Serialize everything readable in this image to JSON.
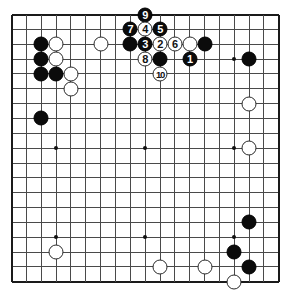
{
  "diagram": {
    "type": "go-board-problem-diagram",
    "board_size": 19,
    "colors": {
      "background": "#ffffff",
      "grid": "#4a4a4a",
      "border": "#1a1a1a",
      "black_stone": "#0b0b0b",
      "white_stone": "#ffffff",
      "black_label_text": "#ffffff",
      "white_label_text": "#111111"
    },
    "geometry": {
      "origin_x": 11.5,
      "origin_y": 14.5,
      "spacing": 14.85,
      "stone_diameter": 15.0,
      "hoshi_diameter": 4
    },
    "hoshi": [
      {
        "col": 3,
        "row": 3
      },
      {
        "col": 9,
        "row": 3
      },
      {
        "col": 15,
        "row": 3
      },
      {
        "col": 3,
        "row": 9
      },
      {
        "col": 9,
        "row": 9
      },
      {
        "col": 15,
        "row": 9
      },
      {
        "col": 3,
        "row": 15
      },
      {
        "col": 9,
        "row": 15
      },
      {
        "col": 15,
        "row": 15
      }
    ],
    "move_count": 10,
    "stones": [
      {
        "col": 2,
        "row": 2,
        "color": "black",
        "label": ""
      },
      {
        "col": 2,
        "row": 3,
        "color": "black",
        "label": ""
      },
      {
        "col": 2,
        "row": 4,
        "color": "black",
        "label": ""
      },
      {
        "col": 3,
        "row": 4,
        "color": "black",
        "label": ""
      },
      {
        "col": 3,
        "row": 2,
        "color": "white",
        "label": ""
      },
      {
        "col": 3,
        "row": 3,
        "color": "white",
        "label": ""
      },
      {
        "col": 4,
        "row": 4,
        "color": "white",
        "label": ""
      },
      {
        "col": 4,
        "row": 5,
        "color": "white",
        "label": ""
      },
      {
        "col": 6,
        "row": 2,
        "color": "white",
        "label": ""
      },
      {
        "col": 2,
        "row": 7,
        "color": "black",
        "label": ""
      },
      {
        "col": 8,
        "row": 2,
        "color": "black",
        "label": ""
      },
      {
        "col": 9,
        "row": 0,
        "color": "black",
        "label": "9"
      },
      {
        "col": 8,
        "row": 1,
        "color": "black",
        "label": "7"
      },
      {
        "col": 9,
        "row": 1,
        "color": "white",
        "label": "4"
      },
      {
        "col": 10,
        "row": 1,
        "color": "black",
        "label": "5"
      },
      {
        "col": 9,
        "row": 2,
        "color": "black",
        "label": "3"
      },
      {
        "col": 10,
        "row": 2,
        "color": "white",
        "label": "2"
      },
      {
        "col": 11,
        "row": 2,
        "color": "white",
        "label": "6"
      },
      {
        "col": 9,
        "row": 3,
        "color": "white",
        "label": "8"
      },
      {
        "col": 10,
        "row": 3,
        "color": "black",
        "label": ""
      },
      {
        "col": 10,
        "row": 4,
        "color": "white",
        "label": "10"
      },
      {
        "col": 12,
        "row": 2,
        "color": "white",
        "label": ""
      },
      {
        "col": 13,
        "row": 2,
        "color": "black",
        "label": ""
      },
      {
        "col": 12,
        "row": 3,
        "color": "black",
        "label": "1"
      },
      {
        "col": 16,
        "row": 3,
        "color": "black",
        "label": ""
      },
      {
        "col": 16,
        "row": 6,
        "color": "white",
        "label": ""
      },
      {
        "col": 16,
        "row": 9,
        "color": "white",
        "label": ""
      },
      {
        "col": 16,
        "row": 14,
        "color": "black",
        "label": ""
      },
      {
        "col": 3,
        "row": 16,
        "color": "white",
        "label": ""
      },
      {
        "col": 15,
        "row": 16,
        "color": "black",
        "label": ""
      },
      {
        "col": 10,
        "row": 17,
        "color": "white",
        "label": ""
      },
      {
        "col": 13,
        "row": 17,
        "color": "white",
        "label": ""
      },
      {
        "col": 16,
        "row": 17,
        "color": "black",
        "label": ""
      },
      {
        "col": 15,
        "row": 18,
        "color": "white",
        "label": ""
      }
    ]
  }
}
